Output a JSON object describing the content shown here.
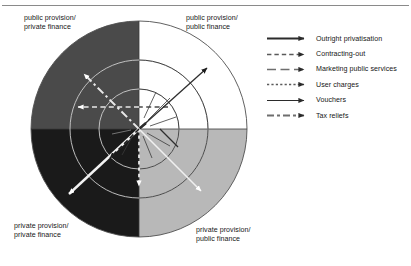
{
  "figure": {
    "background_color": "#ffffff",
    "rule_color": "#8a8a8a"
  },
  "quadrants": [
    {
      "id": "top-left",
      "label": "public provision/\nprivate finance",
      "fill": "#4a4a4a",
      "position": "upper-left"
    },
    {
      "id": "top-right",
      "label": "public provision/\npublic finance",
      "fill": "#ffffff",
      "position": "upper-right"
    },
    {
      "id": "bottom-left",
      "label": "private provision/\nprivate finance",
      "fill": "#1a1a1a",
      "position": "lower-left"
    },
    {
      "id": "bottom-right",
      "label": "private provision/\npublic finance",
      "fill": "#b8b8b8",
      "position": "lower-right"
    }
  ],
  "legend": {
    "items": [
      {
        "label": "Outright privatisation",
        "style": "solid-thick",
        "color": "#2b2b2b"
      },
      {
        "label": "Contracting-out",
        "style": "dashed-short",
        "color": "#5a5a5a"
      },
      {
        "label": "Marketing public services",
        "style": "dashed-long",
        "color": "#6e6e6e"
      },
      {
        "label": "User charges",
        "style": "dotted",
        "color": "#5a5a5a"
      },
      {
        "label": "Vouchers",
        "style": "solid-thin",
        "color": "#2b2b2b"
      },
      {
        "label": "Tax reliefs",
        "style": "dash-dot",
        "color": "#6e6e6e"
      }
    ]
  },
  "diagram": {
    "center": {
      "x": 139,
      "y": 129
    },
    "outer_radius": 108,
    "inner_arcs": [
      {
        "name": "inner-arc-large",
        "cx": 139,
        "cy": 129,
        "r": 69
      },
      {
        "name": "inner-arc-small",
        "cx": 139,
        "cy": 129,
        "r": 40
      }
    ],
    "arrows": [
      {
        "name": "outright-privatisation",
        "legend": "Outright privatisation",
        "angle_deg": 225,
        "length": 96,
        "into_quadrant": "private provision/private finance"
      },
      {
        "name": "contracting-out",
        "legend": "Contracting-out",
        "angle_deg": 180,
        "length": 62,
        "into_quadrant": "public provision/private finance"
      },
      {
        "name": "marketing-public-services",
        "legend": "Marketing public services",
        "angle_deg": 42,
        "length": 86,
        "into_quadrant": "public provision/public finance"
      },
      {
        "name": "user-charges",
        "legend": "User charges",
        "angle_deg": 270,
        "length": 57,
        "into_quadrant": "private provision/public finance"
      },
      {
        "name": "vouchers",
        "legend": "Vouchers",
        "angle_deg": 315,
        "length": 88,
        "into_quadrant": "private provision/public finance"
      },
      {
        "name": "tax-reliefs",
        "legend": "Tax reliefs",
        "angle_deg": 135,
        "length": 78,
        "into_quadrant": "public provision/private finance"
      }
    ]
  }
}
